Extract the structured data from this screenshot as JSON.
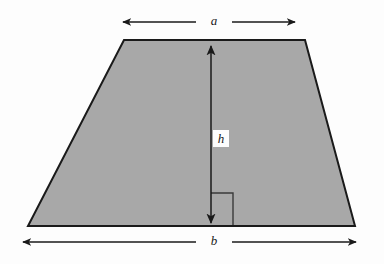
{
  "figure": {
    "kind": "geometry-diagram",
    "shape_name": "trapezoid",
    "background_color": "#fdfdfd",
    "fill_color": "#a8a8a8",
    "outline_color": "#1a1a1a",
    "annotation_color": "#1a1a1a"
  },
  "labels": {
    "top_base": "a",
    "bottom_base": "b",
    "height": "h"
  },
  "geometry": {
    "vertices": [
      {
        "name": "top-left",
        "x": 124,
        "y": 40
      },
      {
        "name": "top-right",
        "x": 305,
        "y": 40
      },
      {
        "name": "bottom-right",
        "x": 355,
        "y": 226
      },
      {
        "name": "bottom-left",
        "x": 28,
        "y": 226
      }
    ],
    "top_dimension_line": {
      "y": 22,
      "x_start": 122,
      "x_end": 296,
      "arrows": "both"
    },
    "bottom_dimension_line": {
      "y": 242,
      "x_start": 22,
      "x_end": 357,
      "arrows": "both"
    },
    "height_dimension_line": {
      "x": 211,
      "y_start": 45,
      "y_end": 224,
      "arrows": "both"
    },
    "right_angle_marker": {
      "x": 211,
      "y": 193,
      "size": 22
    }
  }
}
